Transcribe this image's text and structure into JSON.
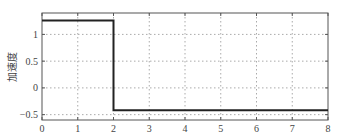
{
  "chart_data": {
    "type": "line",
    "title": "",
    "xlabel": "",
    "ylabel": "加速度",
    "xlim": [
      0,
      8
    ],
    "ylim": [
      -0.6,
      1.4
    ],
    "xticks": [
      0,
      1,
      2,
      3,
      4,
      5,
      6,
      7,
      8
    ],
    "yticks": [
      -0.5,
      0,
      0.5,
      1
    ],
    "ytick_labels": [
      "−0.5",
      "0",
      "0.5",
      "1"
    ],
    "grid": true,
    "series": [
      {
        "name": "acceleration",
        "color": "#222222",
        "x": [
          0,
          2,
          2,
          8
        ],
        "y": [
          1.26,
          1.26,
          -0.42,
          -0.42
        ]
      }
    ]
  }
}
